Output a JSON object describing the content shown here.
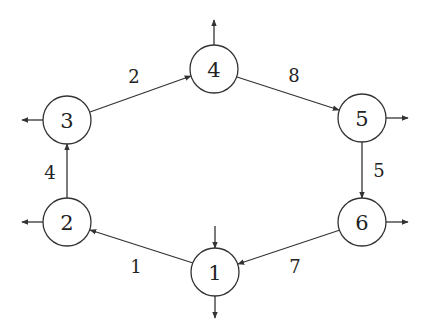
{
  "diagram": {
    "type": "directed-graph",
    "colors": {
      "stroke": "#333333",
      "text": "#222222",
      "background": "#ffffff"
    },
    "nodes": [
      {
        "id": "1",
        "label": "1",
        "x": 215,
        "y": 272,
        "r": 24
      },
      {
        "id": "2",
        "label": "2",
        "x": 67,
        "y": 222,
        "r": 24
      },
      {
        "id": "3",
        "label": "3",
        "x": 67,
        "y": 120,
        "r": 24
      },
      {
        "id": "4",
        "label": "4",
        "x": 214,
        "y": 69,
        "r": 24
      },
      {
        "id": "5",
        "label": "5",
        "x": 362,
        "y": 118,
        "r": 24
      },
      {
        "id": "6",
        "label": "6",
        "x": 362,
        "y": 222,
        "r": 24
      }
    ],
    "edges": [
      {
        "from": "1",
        "to": "2",
        "label": "1",
        "x1": 193,
        "y1": 263,
        "x2": 90,
        "y2": 230,
        "lx": 136,
        "ly": 266
      },
      {
        "from": "2",
        "to": "3",
        "label": "4",
        "x1": 67,
        "y1": 198,
        "x2": 67,
        "y2": 144,
        "lx": 50,
        "ly": 172
      },
      {
        "from": "3",
        "to": "4",
        "label": "2",
        "x1": 90,
        "y1": 112,
        "x2": 191,
        "y2": 76,
        "lx": 134,
        "ly": 76
      },
      {
        "from": "4",
        "to": "5",
        "label": "8",
        "x1": 237,
        "y1": 77,
        "x2": 339,
        "y2": 110,
        "lx": 294,
        "ly": 75
      },
      {
        "from": "5",
        "to": "6",
        "label": "5",
        "x1": 362,
        "y1": 142,
        "x2": 362,
        "y2": 198,
        "lx": 379,
        "ly": 170
      },
      {
        "from": "6",
        "to": "1",
        "label": "7",
        "x1": 340,
        "y1": 230,
        "x2": 238,
        "y2": 264,
        "lx": 295,
        "ly": 266
      }
    ],
    "external_arrows": [
      {
        "node": "4",
        "direction": "out",
        "x1": 214,
        "y1": 45,
        "x2": 214,
        "y2": 20
      },
      {
        "node": "3",
        "direction": "out",
        "x1": 43,
        "y1": 120,
        "x2": 22,
        "y2": 120
      },
      {
        "node": "5",
        "direction": "out",
        "x1": 386,
        "y1": 118,
        "x2": 408,
        "y2": 118
      },
      {
        "node": "2",
        "direction": "out",
        "x1": 43,
        "y1": 222,
        "x2": 22,
        "y2": 222
      },
      {
        "node": "6",
        "direction": "out",
        "x1": 386,
        "y1": 222,
        "x2": 408,
        "y2": 222
      },
      {
        "node": "1",
        "direction": "in",
        "x1": 215,
        "y1": 226,
        "x2": 215,
        "y2": 248
      },
      {
        "node": "1",
        "direction": "out",
        "x1": 215,
        "y1": 296,
        "x2": 215,
        "y2": 318
      }
    ]
  }
}
